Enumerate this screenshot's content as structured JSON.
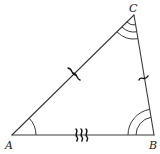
{
  "diagram": {
    "type": "triangle",
    "vertices": {
      "A": {
        "label": "A",
        "x": 12,
        "y": 135
      },
      "B": {
        "label": "B",
        "x": 154,
        "y": 135
      },
      "C": {
        "label": "C",
        "x": 134,
        "y": 15
      }
    },
    "sides": [
      {
        "name": "AB",
        "tick_marks": 3,
        "tick_style": "squiggle"
      },
      {
        "name": "AC",
        "tick_marks": 2,
        "tick_style": "squiggle"
      },
      {
        "name": "BC",
        "tick_marks": 1,
        "tick_style": "squiggle"
      }
    ],
    "angles": [
      {
        "vertex": "A",
        "arcs": 1
      },
      {
        "vertex": "B",
        "arcs": 2
      },
      {
        "vertex": "C",
        "arcs": 3
      }
    ],
    "colors": {
      "stroke": "#3a3a3a",
      "background": "#ffffff"
    }
  }
}
